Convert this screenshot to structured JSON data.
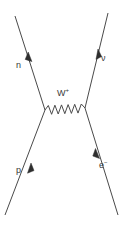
{
  "diagram": {
    "type": "feynman-diagram",
    "title": "",
    "process": "n p -> W+ exchange",
    "background_color": "#ffffff",
    "line_color": "#4a4a4a",
    "text_color": "#3a3a3a",
    "labels": {
      "neutron": "n",
      "neutrino": "ν",
      "proton": "p",
      "electron_base": "e",
      "electron_sup": "−",
      "wboson_base": "W",
      "wboson_sup": "+"
    },
    "legs": [
      {
        "name": "neutron-out",
        "label": "n",
        "from": [
          45,
          110
        ],
        "to": [
          15,
          16
        ],
        "arrow_at": [
          28,
          55
        ],
        "arrow_direction": "outgoing-up-left"
      },
      {
        "name": "neutrino-out",
        "label": "ν",
        "from": [
          85,
          108
        ],
        "to": [
          108,
          13
        ],
        "arrow_at": [
          97,
          52
        ],
        "arrow_direction": "outgoing-up-right"
      },
      {
        "name": "proton-in",
        "label": "p",
        "from": [
          5,
          215
        ],
        "to": [
          45,
          110
        ],
        "arrow_at": [
          28,
          167
        ],
        "arrow_direction": "incoming-up-right"
      },
      {
        "name": "electron-out",
        "label": "e−",
        "from": [
          118,
          215
        ],
        "to": [
          85,
          108
        ],
        "arrow_at": [
          98,
          152
        ],
        "arrow_direction": "outgoing-up-left"
      }
    ],
    "propagator": {
      "name": "w-boson-propagator",
      "label": "W+",
      "style": "wavy",
      "from": [
        45,
        110
      ],
      "to": [
        85,
        108
      ],
      "oscillations": 6,
      "amplitude": 5
    }
  }
}
